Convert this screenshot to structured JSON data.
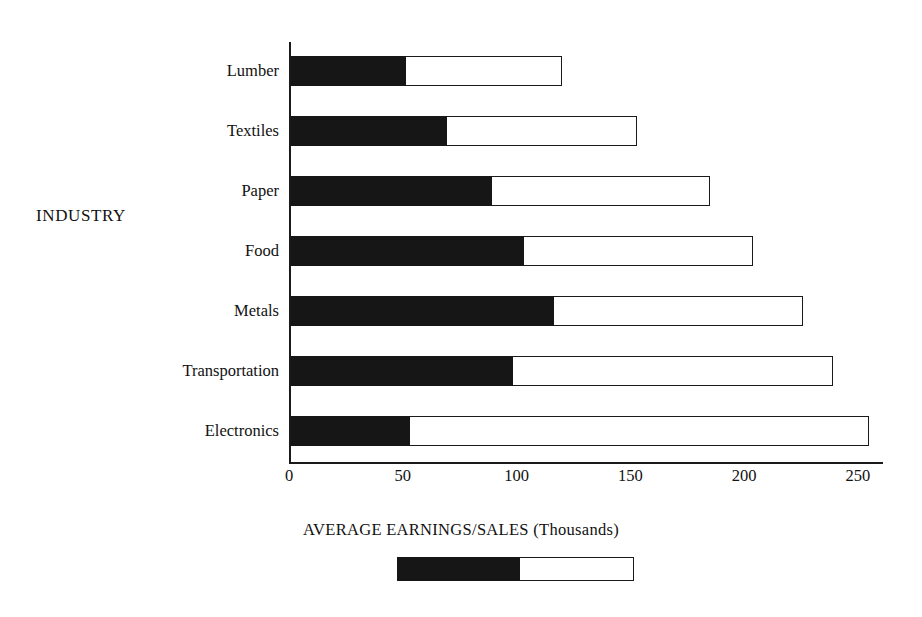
{
  "chart_data": {
    "type": "bar",
    "orientation": "horizontal",
    "stacked": true,
    "title": "",
    "xlabel": "AVERAGE EARNINGS/SALES (Thousands)",
    "ylabel": "INDUSTRY",
    "categories": [
      "Lumber",
      "Textiles",
      "Paper",
      "Food",
      "Metals",
      "Transportation",
      "Electronics"
    ],
    "series": [
      {
        "name": "earnings",
        "style": "solid-black",
        "color": "#161616",
        "values": [
          50,
          68,
          88,
          102,
          115,
          97,
          52
        ]
      },
      {
        "name": "sales",
        "style": "open-white",
        "color": "#ffffff",
        "values": [
          69,
          84,
          96,
          101,
          110,
          141,
          202
        ]
      }
    ],
    "totals": [
      119,
      152,
      184,
      203,
      225,
      238,
      254
    ],
    "xlim": [
      0,
      261
    ],
    "xticks": [
      0,
      50,
      100,
      150,
      200,
      250
    ],
    "xtick_labels": [
      "0",
      "50",
      "100",
      "150",
      "200",
      "250"
    ],
    "grid": false,
    "legend": {
      "position": "below-axis-label",
      "swatch": "two-segment-bar",
      "dark_fraction": 0.52
    }
  },
  "axis": {
    "y_title": "INDUSTRY",
    "x_caption": "AVERAGE EARNINGS/SALES (Thousands)"
  }
}
